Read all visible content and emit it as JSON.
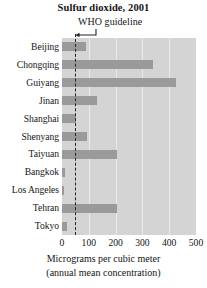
{
  "chart_data": {
    "type": "bar",
    "orientation": "horizontal",
    "title": "Sulfur dioxide, 2001",
    "xlabel_line1": "Micrograms per cubic meter",
    "xlabel_line2": "(annual mean concentration)",
    "ylabel": "",
    "categories": [
      "Beijing",
      "Chongqing",
      "Guiyang",
      "Jinan",
      "Shanghai",
      "Shenyang",
      "Taiyuan",
      "Bangkok",
      "Los Angeles",
      "Tehran",
      "Tokyo"
    ],
    "values": [
      90,
      340,
      424,
      130,
      53,
      95,
      205,
      11,
      9,
      205,
      18
    ],
    "xlim": [
      0,
      500
    ],
    "xticks": [
      0,
      100,
      200,
      300,
      400,
      500
    ],
    "xtick_labels": [
      "0",
      "100",
      "200",
      "300",
      "400",
      "500"
    ],
    "grid": true,
    "gridlines_at": [
      100,
      200,
      300,
      400
    ],
    "legend": "none",
    "annotation": {
      "label": "WHO guideline",
      "value": 50,
      "line_style": "dashed",
      "arrow": "left"
    },
    "colors": {
      "bar": "#9a9a9a",
      "plot_background": "#d4d4d4",
      "gridline": "#e9e9e9",
      "annotation_line": "#232323",
      "text": "#141414",
      "figure_background": "#ffffff"
    }
  }
}
